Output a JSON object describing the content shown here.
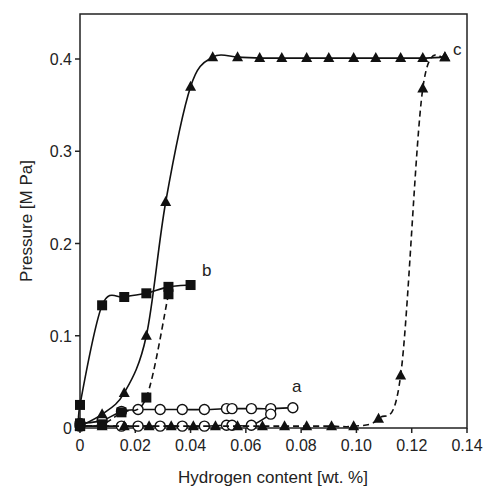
{
  "chart_data": {
    "type": "line",
    "title": "",
    "xlabel": "Hydrogen content [wt. %]",
    "ylabel": "Pressure [M Pa]",
    "xlim": [
      0,
      0.14
    ],
    "ylim": [
      0,
      0.45
    ],
    "xticks": [
      "0",
      "0.02",
      "0.04",
      "0.06",
      "0.08",
      "0.10",
      "0.12",
      "0.14"
    ],
    "yticks": [
      "0",
      "0.1",
      "0.2",
      "0.3",
      "0.4"
    ],
    "grid": false,
    "legend": "inline labels",
    "series": [
      {
        "name": "a",
        "label": "a",
        "marker": "open-circle",
        "branch": "absorption",
        "line": "solid",
        "x": [
          0,
          0.008,
          0.015,
          0.021,
          0.029,
          0.037,
          0.045,
          0.053,
          0.055,
          0.062,
          0.069,
          0.077
        ],
        "y": [
          0.005,
          0.008,
          0.018,
          0.02,
          0.02,
          0.02,
          0.02,
          0.021,
          0.021,
          0.021,
          0.021,
          0.022
        ]
      },
      {
        "name": "a-desorption",
        "label": "",
        "marker": "open-circle",
        "branch": "desorption",
        "line": "solid",
        "x": [
          0,
          0.015,
          0.021,
          0.029,
          0.037,
          0.045,
          0.053,
          0.055,
          0.062,
          0.069
        ],
        "y": [
          0.002,
          0.002,
          0.002,
          0.002,
          0.002,
          0.002,
          0.003,
          0.003,
          0.003,
          0.015
        ]
      },
      {
        "name": "b",
        "label": "b",
        "marker": "filled-square",
        "branch": "absorption",
        "line": "solid",
        "x": [
          0,
          0,
          0.008,
          0.016,
          0.024,
          0.032,
          0.04
        ],
        "y": [
          0.005,
          0.025,
          0.133,
          0.142,
          0.146,
          0.153,
          0.155
        ]
      },
      {
        "name": "b-desorption",
        "label": "",
        "marker": "filled-square",
        "branch": "desorption",
        "line": "dashed",
        "x": [
          0.032,
          0.024,
          0.015,
          0.008,
          0
        ],
        "y": [
          0.145,
          0.033,
          0.017,
          0.004,
          0.002
        ]
      },
      {
        "name": "c",
        "label": "c",
        "marker": "filled-triangle",
        "branch": "absorption",
        "line": "solid",
        "x": [
          0,
          0.008,
          0.016,
          0.024,
          0.031,
          0.04,
          0.048,
          0.057,
          0.065,
          0.073,
          0.082,
          0.09,
          0.099,
          0.107,
          0.116,
          0.124,
          0.132
        ],
        "y": [
          0.002,
          0.015,
          0.038,
          0.1,
          0.245,
          0.37,
          0.402,
          0.402,
          0.401,
          0.401,
          0.401,
          0.401,
          0.401,
          0.401,
          0.401,
          0.401,
          0.402
        ]
      },
      {
        "name": "c-desorption",
        "label": "",
        "marker": "filled-triangle",
        "branch": "desorption",
        "line": "dashed",
        "x": [
          0.132,
          0.124,
          0.116,
          0.108,
          0.099,
          0.091,
          0.082,
          0.074,
          0.066,
          0.057,
          0.049,
          0.041,
          0.033,
          0.025,
          0.016,
          0.008,
          0
        ],
        "y": [
          0.402,
          0.368,
          0.057,
          0.01,
          0.002,
          0.002,
          0.002,
          0.002,
          0.002,
          0.002,
          0.002,
          0.002,
          0.002,
          0.002,
          0.002,
          0.002,
          0.002
        ]
      }
    ]
  }
}
